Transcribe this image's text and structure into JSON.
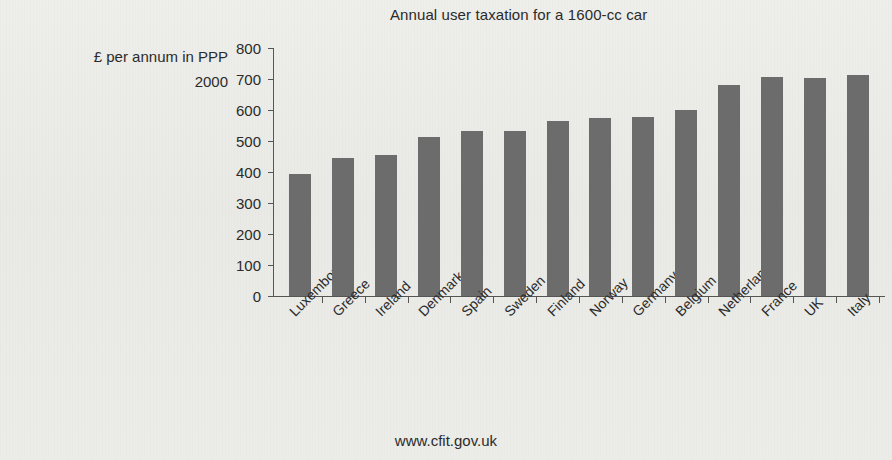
{
  "chart_data": {
    "type": "bar",
    "title": "Annual user taxation for a 1600-cc car",
    "ylabel": "£ per annum in PPP 2000",
    "ylabel_line1": "£ per annum in PPP",
    "ylabel_line2": "2000",
    "xlabel": "",
    "categories": [
      "Luxembourg",
      "Greece",
      "Ireland",
      "Denmark",
      "Spain",
      "Sweden",
      "Finland",
      "Norway",
      "Germany",
      "Belgium",
      "Netherlands",
      "France",
      "UK",
      "Italy"
    ],
    "values": [
      395,
      445,
      455,
      512,
      532,
      533,
      565,
      573,
      578,
      600,
      682,
      706,
      702,
      712
    ],
    "ylim": [
      0,
      800
    ],
    "yticks": [
      0,
      100,
      200,
      300,
      400,
      500,
      600,
      700,
      800
    ],
    "ytick_labels": [
      "0",
      "100",
      "200",
      "300",
      "400",
      "500",
      "600",
      "700",
      "800"
    ],
    "grid": false,
    "legend": "none",
    "bar_color": "#6c6c6c",
    "axis_color": "#555555",
    "background_color": "#ebebe7",
    "text_color": "#2b2b2b"
  },
  "footer": {
    "source_url": "www.cfit.gov.uk"
  }
}
